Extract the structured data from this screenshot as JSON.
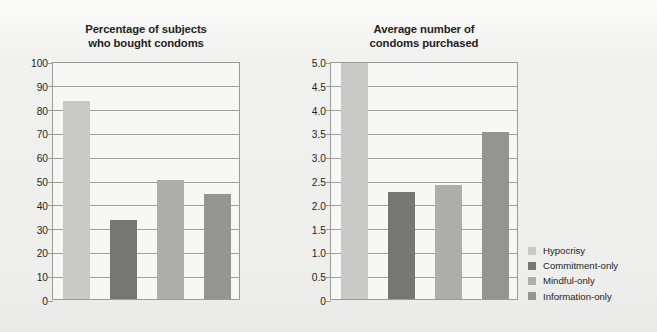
{
  "figure": {
    "background_color": "#efefed",
    "plot_background_color": "#f7f7f5",
    "axis_color": "#9a9a98",
    "text_color": "#231f20"
  },
  "legend": {
    "position": "right",
    "entries": [
      {
        "label": "Hypocrisy",
        "color": "#c9c9c7"
      },
      {
        "label": "Commitment-only",
        "color": "#767674"
      },
      {
        "label": "Mindful-only",
        "color": "#adadab"
      },
      {
        "label": "Information-only",
        "color": "#949492"
      }
    ]
  },
  "chart_data": [
    {
      "type": "bar",
      "title": "Percentage of subjects who bought condoms",
      "title_lines": [
        "Percentage of subjects",
        "who bought condoms"
      ],
      "categories": [
        "Hypocrisy",
        "Commitment-only",
        "Mindful-only",
        "Information-only"
      ],
      "values": [
        83,
        33,
        50,
        44
      ],
      "colors": [
        "#c9c9c7",
        "#767674",
        "#adadab",
        "#949492"
      ],
      "xlabel": "",
      "ylabel": "",
      "ylim": [
        0,
        100
      ],
      "yticks": [
        0,
        10,
        20,
        30,
        40,
        50,
        60,
        70,
        80,
        90,
        100
      ],
      "ytick_labels": [
        "0",
        "10",
        "20",
        "30",
        "40",
        "50",
        "60",
        "70",
        "80",
        "90",
        "100"
      ],
      "grid": true,
      "legend_position": "external-right"
    },
    {
      "type": "bar",
      "title": "Average number of condoms purchased",
      "title_lines": [
        "Average number of",
        "condoms purchased"
      ],
      "categories": [
        "Hypocrisy",
        "Commitment-only",
        "Mindful-only",
        "Information-only"
      ],
      "values": [
        4.95,
        2.25,
        2.4,
        3.5
      ],
      "colors": [
        "#c9c9c7",
        "#767674",
        "#adadab",
        "#949492"
      ],
      "xlabel": "",
      "ylabel": "",
      "ylim": [
        0,
        5.0
      ],
      "yticks": [
        0,
        0.5,
        1.0,
        1.5,
        2.0,
        2.5,
        3.0,
        3.5,
        4.0,
        4.5,
        5.0
      ],
      "ytick_labels": [
        "0",
        "0.5",
        "1.0",
        "1.5",
        "2.0",
        "2.5",
        "3.0",
        "3.5",
        "4.0",
        "4.5",
        "5.0"
      ],
      "grid": true,
      "legend_position": "external-right"
    }
  ]
}
